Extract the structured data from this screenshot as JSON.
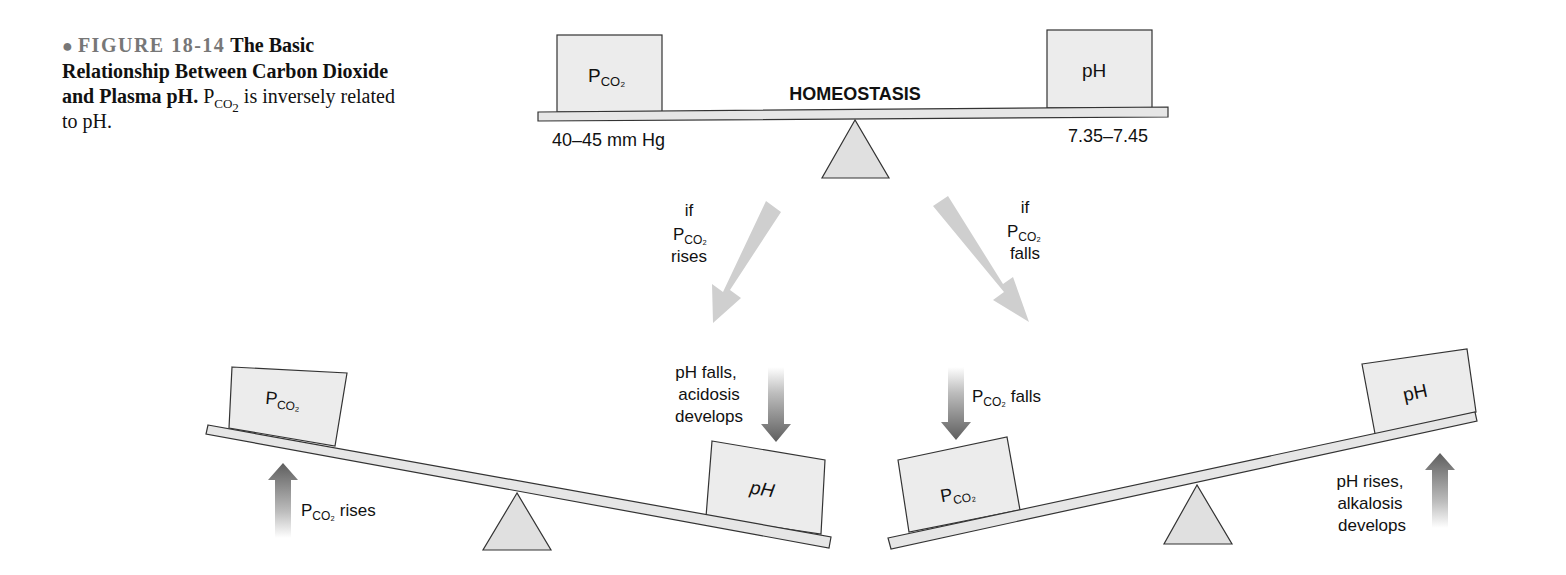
{
  "caption": {
    "bullet": "●",
    "figure_number": "FIGURE 18-14",
    "title": "The Basic Relationship Between Carbon Dioxide and Plasma pH.",
    "body_prefix": "P",
    "body_sub": "CO",
    "body_sub2": "2",
    "body_suffix": " is inversely related to pH."
  },
  "colors": {
    "box_fill": "#ececec",
    "beam_fill": "#e6e6e6",
    "stroke": "#333333",
    "light_arrow": "#cfcfcf",
    "dark_arrow": "#6a6a6a",
    "text": "#111111"
  },
  "top_seesaw": {
    "label": "HOMEOSTASIS",
    "left_box": {
      "main": "P",
      "sub": "CO₂"
    },
    "right_box": {
      "main": "pH"
    },
    "left_value": "40–45 mm Hg",
    "right_value": "7.35–7.45"
  },
  "branch_arrows": {
    "left": {
      "line1": "if",
      "line2_main": "P",
      "line2_sub": "CO₂",
      "line3": "rises"
    },
    "right": {
      "line1": "if",
      "line2_main": "P",
      "line2_sub": "CO₂",
      "line3": "falls"
    }
  },
  "bottom_left_seesaw": {
    "left_box": {
      "main": "P",
      "sub": "CO₂"
    },
    "right_box": {
      "main": "pH"
    },
    "up_arrow_label": {
      "main": "P",
      "sub": "CO₂",
      "suffix": " rises"
    },
    "down_arrow_label": [
      "pH falls,",
      "acidosis",
      "develops"
    ]
  },
  "bottom_right_seesaw": {
    "left_box": {
      "main": "P",
      "sub": "CO₂"
    },
    "right_box": {
      "main": "pH"
    },
    "down_arrow_label": {
      "main": "P",
      "sub": "CO₂",
      "suffix": " falls"
    },
    "up_arrow_label": [
      "pH rises,",
      "alkalosis",
      "develops"
    ]
  }
}
